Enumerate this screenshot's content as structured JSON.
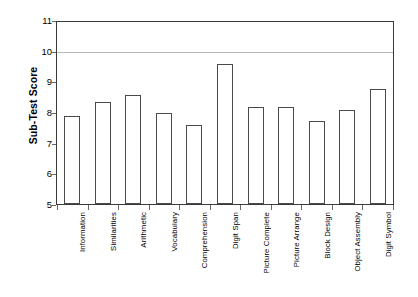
{
  "chart_data": {
    "type": "bar",
    "title": "",
    "xlabel": "",
    "ylabel": "Sub-Test Score",
    "ylim": [
      5,
      11
    ],
    "yticks": [
      5,
      6,
      7,
      8,
      9,
      10,
      11
    ],
    "grid": "horizontal reference line at 10",
    "legend": "none",
    "categories": [
      "Information",
      "Similarities",
      "Arithmetic",
      "Vocabulary",
      "Comprehension",
      "Digit Span",
      "Picture Complete",
      "Picture Arrange",
      "Block Design",
      "Object Assembly",
      "Digit Symbol"
    ],
    "values": [
      7.9,
      8.35,
      8.6,
      8.0,
      7.6,
      9.6,
      8.2,
      8.2,
      7.75,
      8.1,
      8.8
    ],
    "bar_style": {
      "fill": "#ffffff",
      "edge": "#4a4a4a"
    },
    "axis_color": "#3a3a3a",
    "gridline_color": "#b9b9b9",
    "reference_line_value": 10
  }
}
